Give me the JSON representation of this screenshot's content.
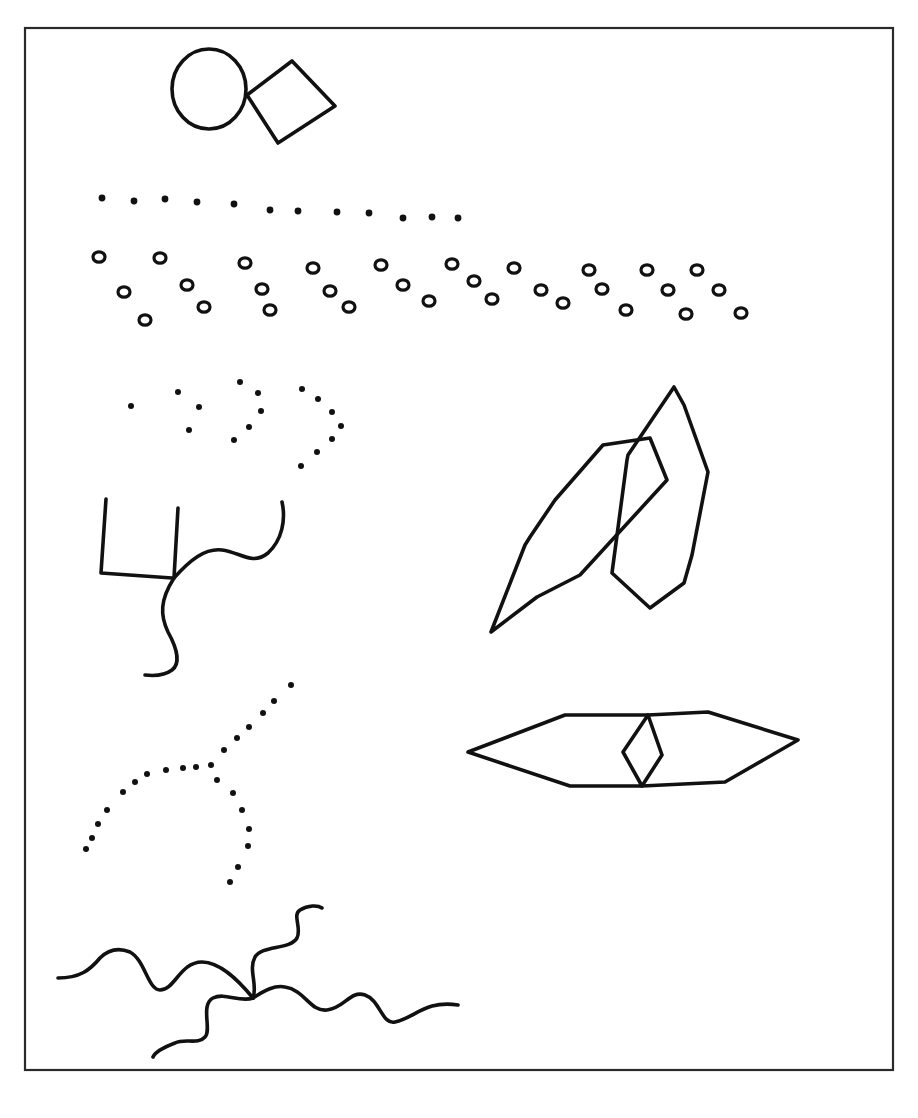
{
  "figure": {
    "frame": {
      "x": 25,
      "y": 28,
      "width": 868,
      "height": 1042
    },
    "ink_color": "#111111",
    "background": "#ffffff"
  },
  "shapes": {
    "circle_diamond": {
      "circle": {
        "cx": 209,
        "cy": 89,
        "rx": 37,
        "ry": 40
      },
      "diamond": "247,95 292,61 335,106 278,143"
    },
    "dot_row": [
      [
        102,
        198
      ],
      [
        134,
        201
      ],
      [
        165,
        199
      ],
      [
        197,
        202
      ],
      [
        234,
        204
      ],
      [
        270,
        210
      ],
      [
        298,
        211
      ],
      [
        337,
        212
      ],
      [
        369,
        213
      ],
      [
        403,
        218
      ],
      [
        432,
        217
      ],
      [
        458,
        218
      ]
    ],
    "ring_rows": [
      [
        99,
        257
      ],
      [
        160,
        258
      ],
      [
        245,
        263
      ],
      [
        313,
        268
      ],
      [
        381,
        265
      ],
      [
        452,
        264
      ],
      [
        514,
        268
      ],
      [
        589,
        270
      ],
      [
        647,
        270
      ],
      [
        697,
        270
      ],
      [
        124,
        292
      ],
      [
        187,
        285
      ],
      [
        262,
        289
      ],
      [
        330,
        291
      ],
      [
        403,
        285
      ],
      [
        474,
        281
      ],
      [
        541,
        290
      ],
      [
        602,
        289
      ],
      [
        668,
        290
      ],
      [
        719,
        290
      ],
      [
        145,
        320
      ],
      [
        204,
        307
      ],
      [
        270,
        310
      ],
      [
        349,
        307
      ],
      [
        429,
        301
      ],
      [
        492,
        299
      ],
      [
        563,
        303
      ],
      [
        626,
        310
      ],
      [
        686,
        314
      ],
      [
        741,
        313
      ]
    ],
    "dot_chevrons": [
      [
        [
          131,
          406
        ]
      ],
      [
        [
          178,
          392
        ],
        [
          199,
          407
        ],
        [
          189,
          430
        ]
      ],
      [
        [
          240,
          382
        ],
        [
          258,
          393
        ],
        [
          261,
          411
        ],
        [
          249,
          427
        ],
        [
          234,
          440
        ]
      ],
      [
        [
          302,
          389
        ],
        [
          318,
          399
        ],
        [
          332,
          412
        ],
        [
          341,
          426
        ],
        [
          332,
          439
        ],
        [
          317,
          452
        ],
        [
          301,
          466
        ]
      ]
    ],
    "branch": {
      "left_bar": "M106,499 L101,573 L172,578",
      "mid_bar": "M178,508 L174,578",
      "right_curve": "M174,578 C190,560 205,548 222,550 C240,552 252,566 268,553 C282,540 286,520 282,502",
      "down_curve": "M174,578 C160,600 160,615 168,632 C178,650 180,664 172,670 C164,676 154,676 145,675"
    },
    "polygons": {
      "a": "491,632 525,545 530,537 555,500 603,445 650,438 667,480 580,575 537,597 491,632",
      "b": "628,455 674,387 684,405 708,472 692,555 684,583 650,608 612,573 627,460"
    },
    "lens": {
      "outer": "468,752 565,715 648,715 708,712 798,740 725,782 642,786 570,786 468,752",
      "inner": "648,715 623,752 642,786 662,755"
    },
    "dot_curve": [
      [
        291,
        685
      ],
      [
        274,
        701
      ],
      [
        263,
        713
      ],
      [
        249,
        727
      ],
      [
        237,
        738
      ],
      [
        224,
        750
      ],
      [
        211,
        765
      ],
      [
        196,
        767
      ],
      [
        183,
        768
      ],
      [
        166,
        770
      ],
      [
        147,
        774
      ],
      [
        135,
        782
      ],
      [
        123,
        792
      ],
      [
        107,
        810
      ],
      [
        98,
        824
      ],
      [
        92,
        838
      ],
      [
        86,
        849
      ],
      [
        217,
        780
      ],
      [
        233,
        793
      ],
      [
        242,
        810
      ],
      [
        249,
        829
      ],
      [
        248,
        846
      ],
      [
        238,
        867
      ],
      [
        230,
        882
      ]
    ],
    "squiggles": [
      "M58,978 C80,978 90,970 100,958 C110,948 120,948 130,952 C145,960 148,990 160,990 C175,990 180,962 202,962 C220,962 238,980 253,998",
      "M253,998 C258,985 248,970 255,957 C262,945 290,950 297,938 C302,928 292,915 300,910 C308,905 318,905 322,908",
      "M253,998 C265,990 275,985 285,987 C305,990 310,1012 327,1010 C345,1008 350,990 365,995 C380,1000 382,1025 395,1022 C415,1018 425,1000 458,1005",
      "M253,998 C240,1003 225,992 213,998 C200,1005 212,1030 205,1037 C198,1045 185,1038 175,1043 C162,1048 155,1052 153,1057"
    ]
  }
}
